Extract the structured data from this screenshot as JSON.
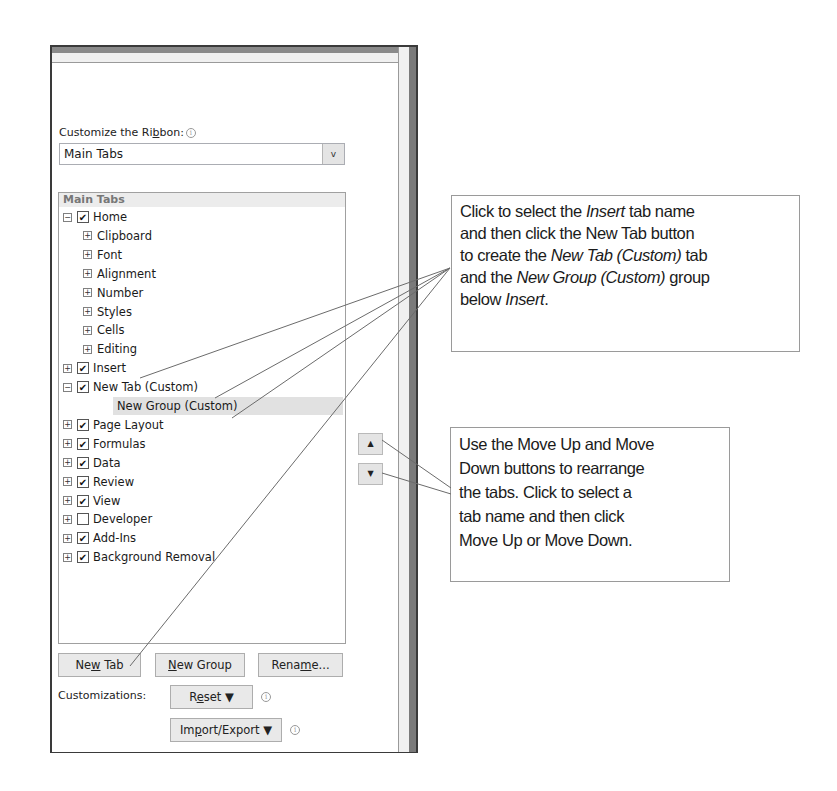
{
  "dialog": {
    "section_label_prefix": "Customize the Ri",
    "section_label_underlined": "b",
    "section_label_suffix": "bon:",
    "info_icon": "i",
    "combo": {
      "value": "Main Tabs",
      "arrow_icon": "v"
    },
    "tree": {
      "header": "Main Tabs",
      "items": [
        {
          "label": "Home",
          "expander": "−",
          "checked": true,
          "level": 0
        },
        {
          "label": "Clipboard",
          "expander": "+",
          "level": 1
        },
        {
          "label": "Font",
          "expander": "+",
          "level": 1
        },
        {
          "label": "Alignment",
          "expander": "+",
          "level": 1
        },
        {
          "label": "Number",
          "expander": "+",
          "level": 1
        },
        {
          "label": "Styles",
          "expander": "+",
          "level": 1
        },
        {
          "label": "Cells",
          "expander": "+",
          "level": 1
        },
        {
          "label": "Editing",
          "expander": "+",
          "level": 1
        },
        {
          "label": "Insert",
          "expander": "+",
          "checked": true,
          "level": 0
        },
        {
          "label": "New Tab (Custom)",
          "expander": "−",
          "checked": true,
          "level": 0
        },
        {
          "label": "New Group (Custom)",
          "level": 2,
          "selected": true
        },
        {
          "label": "Page Layout",
          "expander": "+",
          "checked": true,
          "level": 0
        },
        {
          "label": "Formulas",
          "expander": "+",
          "checked": true,
          "level": 0
        },
        {
          "label": "Data",
          "expander": "+",
          "checked": true,
          "level": 0
        },
        {
          "label": "Review",
          "expander": "+",
          "checked": true,
          "level": 0
        },
        {
          "label": "View",
          "expander": "+",
          "checked": true,
          "level": 0
        },
        {
          "label": "Developer",
          "expander": "+",
          "checked": false,
          "level": 0
        },
        {
          "label": "Add-Ins",
          "expander": "+",
          "checked": true,
          "level": 0
        },
        {
          "label": "Background Removal",
          "expander": "+",
          "checked": true,
          "level": 0
        }
      ],
      "check_glyph": "✔"
    },
    "move_up_icon": "▲",
    "move_down_icon": "▼",
    "buttons": {
      "new_tab": {
        "pre": "Ne",
        "ul": "w",
        "post": " Tab"
      },
      "new_group": {
        "pre": "",
        "ul": "N",
        "post": "ew Group"
      },
      "rename": {
        "pre": "Rena",
        "ul": "m",
        "post": "e..."
      }
    },
    "customizations_label": "Customizations:",
    "reset": {
      "pre": "R",
      "ul": "e",
      "post": "set ▼"
    },
    "import_export": {
      "pre": "Im",
      "ul": "p",
      "post": "ort/Export ▼"
    }
  },
  "callouts": {
    "top": {
      "t1": "Click to select the ",
      "t1i": "Insert",
      "t2": " tab name",
      "line2": "and then click the New Tab button",
      "t3": "to create the ",
      "t3i": "New Tab (Custom)",
      "t4": " tab",
      "t5": "and the ",
      "t5i": "New Group (Custom)",
      "t6": " group",
      "t7": "below ",
      "t7i": "Insert",
      "t8": "."
    },
    "bottom": {
      "line1": "Use the Move Up and Move",
      "line2": "Down buttons to rearrange",
      "line3": "the tabs. Click to select a",
      "line4": "tab name and then click",
      "line5": "Move Up or Move Down."
    }
  },
  "colors": {
    "frame": "#3a3a3a",
    "selection": "#e1e1e1",
    "button_face": "#e9e9e9",
    "callout_border": "#9a9a9a",
    "leader_line": "#6b6b6b"
  }
}
